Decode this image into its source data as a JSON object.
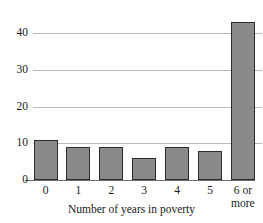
{
  "chart_data": {
    "type": "bar",
    "title": "",
    "xlabel": "Number of years in poverty",
    "ylabel": "",
    "categories": [
      "0",
      "1",
      "2",
      "3",
      "4",
      "5",
      "6 or more"
    ],
    "category_lines": [
      [
        "0"
      ],
      [
        "1"
      ],
      [
        "2"
      ],
      [
        "3"
      ],
      [
        "4"
      ],
      [
        "5"
      ],
      [
        "6 or",
        "more"
      ]
    ],
    "values": [
      11,
      9,
      9,
      6,
      9,
      8,
      43
    ],
    "ylim": [
      0,
      50
    ],
    "yticks": [
      0,
      10,
      20,
      30,
      40
    ],
    "ytick_labels": [
      "0",
      "10",
      "20",
      "30",
      "40"
    ],
    "gridlines": [
      0,
      10,
      20,
      30,
      40,
      50
    ],
    "grid": true,
    "grid_axis": "y",
    "legend": "none",
    "bar_fill_color": "#8a8a8a",
    "bar_edge_color": "#2b2b2b",
    "gridline_color": "#b9b9b9",
    "axis_color": "#6d6d6d",
    "background_color": "#ffffff"
  }
}
